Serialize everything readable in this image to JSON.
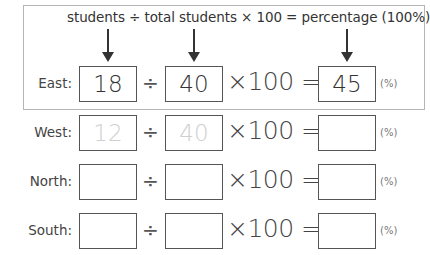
{
  "header": {
    "formula": "students ÷ total students × 100 = percentage (100%)"
  },
  "operators": {
    "divide": "÷",
    "times_100_equals": "×100 =",
    "unit": "(%)"
  },
  "rows": [
    {
      "label": "East:",
      "students": "18",
      "total": "40",
      "percentage": "45",
      "style": "filled"
    },
    {
      "label": "West:",
      "students": "12",
      "total": "40",
      "percentage": "",
      "style": "faint"
    },
    {
      "label": "North:",
      "students": "",
      "total": "",
      "percentage": "",
      "style": "empty"
    },
    {
      "label": "South:",
      "students": "",
      "total": "",
      "percentage": "",
      "style": "empty"
    }
  ]
}
